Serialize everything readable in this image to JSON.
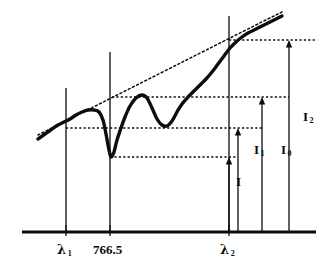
{
  "figure": {
    "ink_color": "#0d0d0d",
    "background_color": "#ffffff"
  },
  "axis": {
    "name": "wavelength-axis",
    "x_start": 22,
    "x_end": 316,
    "y": 232,
    "ticks": [
      {
        "label": "λ",
        "sub": "1",
        "x": 66
      },
      {
        "label": "766.5",
        "sub": "",
        "x": 110
      },
      {
        "label": "λ",
        "sub": "2",
        "x": 229
      }
    ]
  },
  "tick_labels": [
    {
      "name": "lambda-1-label",
      "text": "λ",
      "sub": "1",
      "x": 57,
      "y": 243
    },
    {
      "name": "wavelength-766-5-label",
      "text": "766.5",
      "sub": "",
      "x": 93,
      "y": 243
    },
    {
      "name": "lambda-2-label",
      "text": "λ",
      "sub": "2",
      "x": 220,
      "y": 243
    }
  ],
  "intensity_labels": [
    {
      "name": "intensity-I-label",
      "text": "I",
      "sub": "",
      "x": 236,
      "y": 182
    },
    {
      "name": "intensity-I1-label",
      "text": "I",
      "sub": "1",
      "x": 256,
      "y": 150
    },
    {
      "name": "intensity-I0-label",
      "text": "I",
      "sub": "0",
      "x": 283,
      "y": 150
    },
    {
      "name": "intensity-I2-label",
      "text": "I",
      "sub": "2",
      "x": 305,
      "y": 117
    }
  ],
  "levels": {
    "top_signal_level_y": 40,
    "baseline_high_y": 97,
    "baseline_mid_y": 128,
    "absorption_min_y": 157,
    "axis_y": 232
  },
  "vertical_lines": [
    {
      "name": "lambda-1-gridline",
      "x": 66,
      "y_top": 88,
      "y_bottom": 232
    },
    {
      "name": "line-766-5-gridline",
      "x": 110,
      "y_top": 52,
      "y_bottom": 232
    },
    {
      "name": "lambda-2-gridline",
      "x": 229,
      "y_top": 16,
      "y_bottom": 232
    }
  ],
  "dotted_levels": [
    {
      "name": "top-level-dotted-line",
      "x1": 229,
      "x2": 316,
      "y": 40
    },
    {
      "name": "upper-dotted-line",
      "x1": 112,
      "x2": 289,
      "y": 97
    },
    {
      "name": "mid-dotted-line",
      "x1": 66,
      "x2": 262,
      "y": 128
    },
    {
      "name": "lower-dotted-line",
      "x1": 110,
      "x2": 238,
      "y": 157
    }
  ],
  "arrows": [
    {
      "name": "arrow-I",
      "x": 229,
      "y_base": 232,
      "y_tip": 157
    },
    {
      "name": "arrow-I1",
      "x": 238,
      "y_base": 232,
      "y_tip": 128
    },
    {
      "name": "arrow-I0",
      "x": 262,
      "y_base": 232,
      "y_tip": 97
    },
    {
      "name": "arrow-I2",
      "x": 289,
      "y_base": 232,
      "y_tip": 40
    }
  ],
  "chart_data": {
    "type": "line",
    "xlabel": "Wavelength (nm)",
    "ylabel": "Intensity",
    "grid": false,
    "legend": null,
    "xlim": [
      22,
      316
    ],
    "ylim_pixels": [
      232,
      16
    ],
    "annotations": [
      {
        "text": "λ1",
        "type": "wavelength-marker",
        "x": 66
      },
      {
        "text": "766.5",
        "type": "wavelength-marker",
        "x": 110
      },
      {
        "text": "λ2",
        "type": "wavelength-marker",
        "x": 229
      },
      {
        "text": "I",
        "type": "intensity-measure",
        "value_level_y": 157
      },
      {
        "text": "I1",
        "type": "intensity-measure",
        "value_level_y": 128
      },
      {
        "text": "I0",
        "type": "intensity-measure",
        "value_level_y": 97
      },
      {
        "text": "I2",
        "type": "intensity-measure",
        "value_level_y": 40
      }
    ],
    "series": [
      {
        "name": "measured-spectrum",
        "style": "solid-thick",
        "points": [
          [
            38,
            139
          ],
          [
            45,
            134
          ],
          [
            52,
            129
          ],
          [
            58,
            125
          ],
          [
            64,
            122
          ],
          [
            70,
            119
          ],
          [
            76,
            115
          ],
          [
            82,
            112
          ],
          [
            88,
            110
          ],
          [
            94,
            110
          ],
          [
            99,
            112
          ],
          [
            103,
            120
          ],
          [
            106,
            134
          ],
          [
            109,
            150
          ],
          [
            111,
            157
          ],
          [
            114,
            152
          ],
          [
            117,
            140
          ],
          [
            121,
            128
          ],
          [
            125,
            117
          ],
          [
            130,
            106
          ],
          [
            136,
            98
          ],
          [
            142,
            95
          ],
          [
            147,
            98
          ],
          [
            152,
            108
          ],
          [
            157,
            119
          ],
          [
            162,
            125
          ],
          [
            167,
            126
          ],
          [
            172,
            121
          ],
          [
            177,
            112
          ],
          [
            182,
            104
          ],
          [
            188,
            97
          ],
          [
            194,
            91
          ],
          [
            200,
            85
          ],
          [
            206,
            79
          ],
          [
            212,
            72
          ],
          [
            218,
            64
          ],
          [
            224,
            56
          ],
          [
            230,
            48
          ],
          [
            236,
            42
          ],
          [
            242,
            37
          ],
          [
            248,
            33
          ],
          [
            254,
            30
          ],
          [
            260,
            27
          ],
          [
            266,
            24
          ],
          [
            272,
            21
          ],
          [
            278,
            18
          ],
          [
            282,
            16
          ]
        ]
      },
      {
        "name": "background-tangent-line",
        "style": "dotted",
        "points": [
          [
            38,
            135
          ],
          [
            230,
            38
          ],
          [
            282,
            12
          ]
        ]
      }
    ]
  }
}
